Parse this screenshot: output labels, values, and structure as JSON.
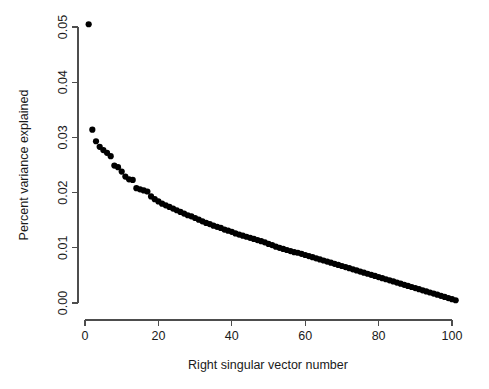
{
  "chart_data": {
    "type": "scatter",
    "title": "",
    "subtitle": "",
    "xlabel": "Right singular vector number",
    "ylabel": "Percent variance explained",
    "xlim": [
      0,
      101
    ],
    "ylim": [
      0.0,
      0.0505
    ],
    "grid": false,
    "legend": null,
    "legend_position": "none",
    "marker": {
      "shape": "filled-circle",
      "color": "#000000",
      "size_px": 3.1
    },
    "xticks": [
      0,
      20,
      40,
      60,
      80,
      100
    ],
    "xtick_labels": [
      "0",
      "20",
      "40",
      "60",
      "80",
      "100"
    ],
    "yticks": [
      0.0,
      0.01,
      0.02,
      0.03,
      0.04,
      0.05
    ],
    "ytick_labels": [
      "0.00",
      "0.01",
      "0.02",
      "0.03",
      "0.04",
      "0.05"
    ],
    "ytick_label_rotation_deg": 90,
    "x": [
      1,
      2,
      3,
      4,
      5,
      6,
      7,
      8,
      9,
      10,
      11,
      12,
      13,
      14,
      15,
      16,
      17,
      18,
      19,
      20,
      21,
      22,
      23,
      24,
      25,
      26,
      27,
      28,
      29,
      30,
      31,
      32,
      33,
      34,
      35,
      36,
      37,
      38,
      39,
      40,
      41,
      42,
      43,
      44,
      45,
      46,
      47,
      48,
      49,
      50,
      51,
      52,
      53,
      54,
      55,
      56,
      57,
      58,
      59,
      60,
      61,
      62,
      63,
      64,
      65,
      66,
      67,
      68,
      69,
      70,
      71,
      72,
      73,
      74,
      75,
      76,
      77,
      78,
      79,
      80,
      81,
      82,
      83,
      84,
      85,
      86,
      87,
      88,
      89,
      90,
      91,
      92,
      93,
      94,
      95,
      96,
      97,
      98,
      99,
      100,
      101
    ],
    "y": [
      0.0505,
      0.0314,
      0.0293,
      0.0283,
      0.0277,
      0.0272,
      0.0266,
      0.0249,
      0.0246,
      0.0238,
      0.0229,
      0.0224,
      0.0223,
      0.0208,
      0.0206,
      0.0204,
      0.0202,
      0.0193,
      0.0188,
      0.0184,
      0.018,
      0.0177,
      0.0174,
      0.0171,
      0.0168,
      0.0165,
      0.0162,
      0.0159,
      0.0157,
      0.0154,
      0.0151,
      0.0148,
      0.0145,
      0.0143,
      0.014,
      0.0138,
      0.0136,
      0.0133,
      0.0131,
      0.0129,
      0.0126,
      0.0124,
      0.0122,
      0.012,
      0.0118,
      0.0116,
      0.0114,
      0.0112,
      0.011,
      0.0107,
      0.0105,
      0.0102,
      0.01,
      0.0098,
      0.0096,
      0.0094,
      0.0092,
      0.0091,
      0.0089,
      0.0087,
      0.0085,
      0.0083,
      0.0081,
      0.0079,
      0.0077,
      0.0075,
      0.0073,
      0.0071,
      0.0069,
      0.0067,
      0.0065,
      0.0063,
      0.0061,
      0.0059,
      0.0057,
      0.0055,
      0.0053,
      0.0051,
      0.0049,
      0.0047,
      0.0045,
      0.0043,
      0.0041,
      0.0039,
      0.0037,
      0.0035,
      0.0033,
      0.0031,
      0.0029,
      0.0027,
      0.0025,
      0.0023,
      0.0021,
      0.0019,
      0.0017,
      0.0015,
      0.0013,
      0.0011,
      0.0009,
      0.0007,
      0.0005
    ],
    "n_points": 101
  },
  "plot_geometry": {
    "x_pixel_at_0": 85,
    "x_pixel_at_100": 452,
    "y_pixel_at_0": 303,
    "y_pixel_at_005": 27
  },
  "colors": {
    "background": "#ffffff",
    "point": "#000000",
    "axis": "#4d4d4d",
    "text": "#1a1a1a"
  }
}
